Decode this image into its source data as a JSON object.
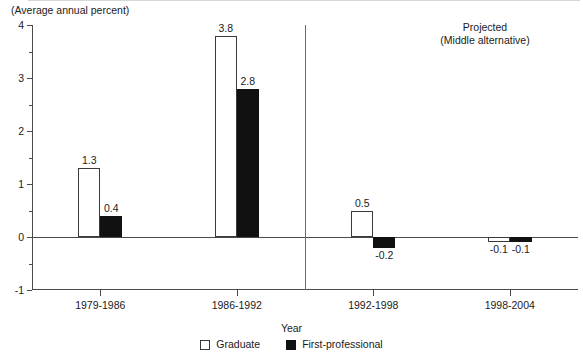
{
  "header": {
    "unit_note": "(Average annual percent)"
  },
  "annotation": {
    "projected_line1": "Projected",
    "projected_line2": "(Middle alternative)"
  },
  "axes": {
    "x_title": "Year",
    "y_ticks": [
      "4",
      "3",
      "2",
      "1",
      "0",
      "-1"
    ]
  },
  "legend": {
    "items": [
      {
        "label": "Graduate",
        "swatch": "white-square-icon",
        "color": "#ffffff"
      },
      {
        "label": "First-professional",
        "swatch": "black-square-icon",
        "color": "#111111"
      }
    ]
  },
  "chart_data": {
    "type": "bar",
    "title": "",
    "subtitle": "(Average annual percent)",
    "xlabel": "Year",
    "ylabel": "",
    "ylim": [
      -1,
      4
    ],
    "ytick_values": [
      4,
      3,
      2,
      1,
      0,
      -1
    ],
    "yminor_values": [
      3.5,
      2.5,
      1.5,
      0.5,
      -0.5
    ],
    "grid": false,
    "legend_position": "bottom-center",
    "categories": [
      "1979-1986",
      "1986-1992",
      "1992-1998",
      "1998-2004"
    ],
    "series": [
      {
        "name": "Graduate",
        "color": "#ffffff",
        "values": [
          1.3,
          3.8,
          0.5,
          -0.1
        ],
        "labels": [
          "1.3",
          "3.8",
          "0.5",
          "-0.1"
        ]
      },
      {
        "name": "First-professional",
        "color": "#111111",
        "values": [
          0.4,
          2.8,
          -0.2,
          -0.1
        ],
        "labels": [
          "0.4",
          "2.8",
          "-0.2",
          "-0.1"
        ]
      }
    ],
    "annotations": [
      {
        "text": "Projected (Middle alternative)",
        "applies_to": [
          "1992-1998",
          "1998-2004"
        ]
      }
    ],
    "divider_after_category": "1986-1992"
  }
}
